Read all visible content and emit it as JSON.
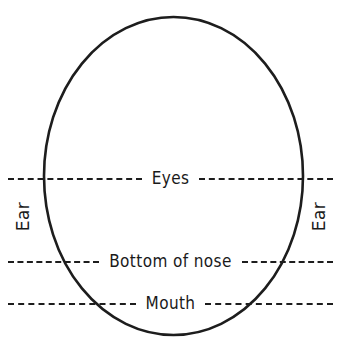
{
  "diagram": {
    "background_color": "#ffffff",
    "ink_color": "#1a1a1a",
    "oval": {
      "name": "head-outline",
      "center_x": 173,
      "center_y": 176,
      "radius_x": 130,
      "radius_y": 159,
      "stroke_color": "#1d1d1d",
      "stroke_width": 2.5,
      "fill": "none"
    },
    "guides": [
      {
        "id": "eyes",
        "label": "Eyes",
        "y": 170,
        "style": "dashed"
      },
      {
        "id": "nose",
        "label": "Bottom of nose",
        "y": 253,
        "style": "dashed"
      },
      {
        "id": "mouth",
        "label": "Mouth",
        "y": 295,
        "style": "dashed"
      }
    ],
    "side_labels": [
      {
        "id": "ear-left",
        "label": "Ear",
        "side": "left",
        "rotation": -90
      },
      {
        "id": "ear-right",
        "label": "Ear",
        "side": "right",
        "rotation": -90
      }
    ]
  }
}
